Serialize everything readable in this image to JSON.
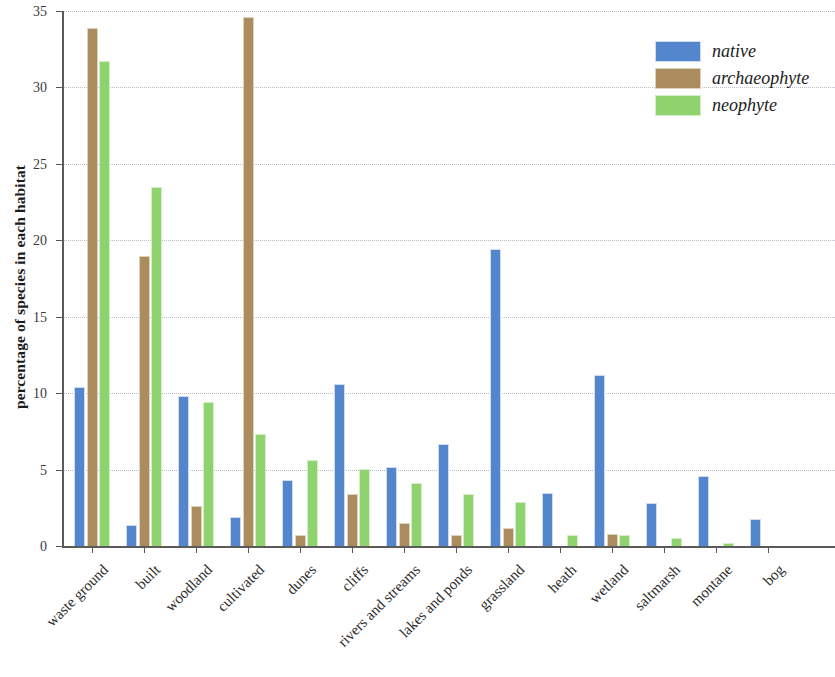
{
  "chart_data": {
    "type": "bar",
    "title": "",
    "subtitle": "",
    "xlabel": "",
    "ylabel": "percentage of species in each habitat",
    "ylim": [
      0,
      35
    ],
    "yticks": [
      0,
      5,
      10,
      15,
      20,
      25,
      30,
      35
    ],
    "ytick_labels": [
      "0",
      "5",
      "10",
      "15",
      "20",
      "25",
      "30",
      "35"
    ],
    "grid": true,
    "grid_axis": "y",
    "legend_position": "top-right",
    "categories": [
      "waste ground",
      "built",
      "woodland",
      "cultivated",
      "dunes",
      "cliffs",
      "rivers and streams",
      "lakes and ponds",
      "grassland",
      "heath",
      "wetland",
      "saltmarsh",
      "montane",
      "bog"
    ],
    "series": [
      {
        "name": "native",
        "color": "#5386cc",
        "values": [
          10.4,
          1.4,
          9.8,
          1.9,
          4.3,
          10.6,
          5.2,
          6.7,
          19.4,
          3.5,
          11.2,
          2.8,
          4.6,
          1.8
        ]
      },
      {
        "name": "archaeophyte",
        "color": "#ab8c5e",
        "values": [
          33.9,
          19.0,
          2.6,
          34.6,
          0.7,
          3.4,
          1.5,
          0.75,
          1.2,
          0,
          0.8,
          0,
          0,
          0
        ]
      },
      {
        "name": "neophyte",
        "color": "#8fd36f",
        "values": [
          31.7,
          23.5,
          9.4,
          7.3,
          5.6,
          5.05,
          4.1,
          3.4,
          2.9,
          0.7,
          0.7,
          0.5,
          0.2,
          0
        ]
      }
    ]
  },
  "legend": {
    "items": [
      {
        "label": "native",
        "key": "native"
      },
      {
        "label": "archaeophyte",
        "key": "archaeophyte"
      },
      {
        "label": "neophyte",
        "key": "neophyte"
      }
    ]
  }
}
